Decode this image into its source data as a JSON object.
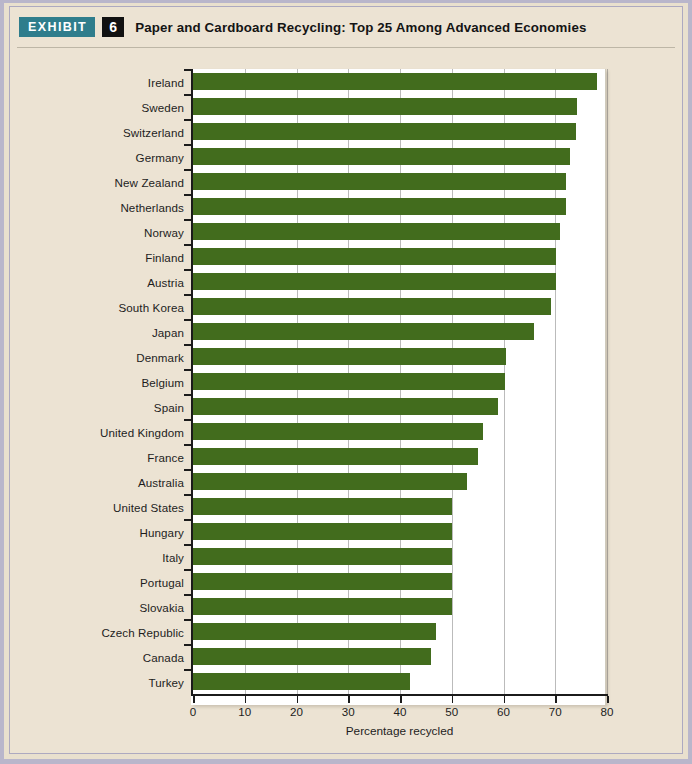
{
  "header": {
    "exhibit_label": "EXHIBIT",
    "exhibit_number": "6",
    "title": "Paper and Cardboard Recycling: Top 25 Among Advanced Economies",
    "badge_color": "#2f7d8c",
    "number_bg_color": "#111111"
  },
  "page": {
    "background_color": "#ece3d3",
    "border_color": "#b9b6cb",
    "plot_background_color": "#ffffff"
  },
  "chart_data": {
    "type": "bar",
    "orientation": "horizontal",
    "title": "Paper and Cardboard Recycling: Top 25 Among Advanced Economies",
    "xlabel": "Percentage recycled",
    "ylabel": "",
    "xlim": [
      0,
      80
    ],
    "xticks": [
      0,
      10,
      20,
      30,
      40,
      50,
      60,
      70,
      80
    ],
    "xtick_labels": [
      "0",
      "10",
      "20",
      "30",
      "40",
      "50",
      "60",
      "70",
      "80"
    ],
    "grid": true,
    "grid_axis": "x",
    "legend": null,
    "bar_color": "#426c1d",
    "categories": [
      "Ireland",
      "Sweden",
      "Switzerland",
      "Germany",
      "New Zealand",
      "Netherlands",
      "Norway",
      "Finland",
      "Austria",
      "South Korea",
      "Japan",
      "Denmark",
      "Belgium",
      "Spain",
      "United Kingdom",
      "France",
      "Australia",
      "United States",
      "Hungary",
      "Italy",
      "Portugal",
      "Slovakia",
      "Czech Republic",
      "Canada",
      "Turkey"
    ],
    "values": [
      78.0,
      74.2,
      74.0,
      72.8,
      72.0,
      72.0,
      71.0,
      70.2,
      70.2,
      69.2,
      65.8,
      60.5,
      60.2,
      59.0,
      56.0,
      55.0,
      53.0,
      50.0,
      50.0,
      50.0,
      50.0,
      50.0,
      47.0,
      46.0,
      42.0
    ]
  }
}
